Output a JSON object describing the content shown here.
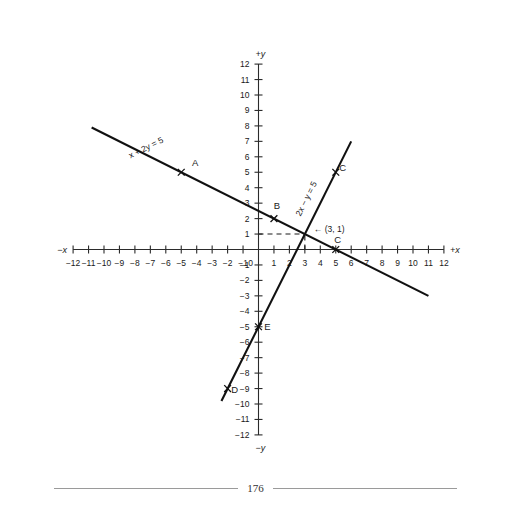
{
  "chart_data": {
    "type": "line",
    "title": "",
    "xlabel": "+x",
    "ylabel": "+y",
    "xlabel_negative": "-x",
    "ylabel_negative": "-y",
    "xlim": [
      -12,
      12
    ],
    "ylim": [
      -12,
      12
    ],
    "grid": false,
    "legend_position": "inline-rotated-labels",
    "x_tick_labels": [
      "-12",
      "-11",
      "-10",
      "-9",
      "-8",
      "-7",
      "-6",
      "-5",
      "-4",
      "-3",
      "-2",
      "-1",
      "0",
      "1",
      "2",
      "3",
      "4",
      "5",
      "6",
      "7",
      "8",
      "9",
      "10",
      "11",
      "12"
    ],
    "y_tick_labels": [
      "12",
      "11",
      "10",
      "9",
      "8",
      "7",
      "6",
      "5",
      "4",
      "3",
      "2",
      "1",
      "0",
      "-1",
      "-2",
      "-3",
      "-4",
      "-5",
      "-6",
      "-7",
      "-8",
      "-9",
      "-10",
      "-11",
      "-12"
    ],
    "origin_label": "0",
    "series": [
      {
        "name": "x + 2y = 5",
        "equation_label": "x + 2y = 5",
        "slope": -0.5,
        "y_intercept": 2.5,
        "x_start": -10.8,
        "x_end": 11.0,
        "label_rotation_deg": -26.6
      },
      {
        "name": "2x - y = 5",
        "equation_label": "2x - y = 5",
        "slope": 2.0,
        "y_intercept": -5.0,
        "x_start": -2.4,
        "x_end": 6.0,
        "label_rotation_deg": -63.4
      }
    ],
    "intersection": {
      "x": 3,
      "y": 1,
      "annotation": "(3, 1)",
      "arrow": "←"
    },
    "marked_points": [
      {
        "label": "A",
        "x": -5,
        "y": 5,
        "label_dx": 14,
        "label_dy": -6
      },
      {
        "label": "B",
        "x": 1,
        "y": 2,
        "label_dx": 3,
        "label_dy": -10
      },
      {
        "label": "C",
        "x": 5,
        "y": 5,
        "label_dx": 7,
        "label_dy": -1
      },
      {
        "label": "C",
        "x": 5,
        "y": 0,
        "label_dx": 2,
        "label_dy": -7
      },
      {
        "label": "D",
        "x": -2,
        "y": -9,
        "label_dx": 7,
        "label_dy": 4
      },
      {
        "label": "E",
        "x": 0,
        "y": -5,
        "label_dx": 9,
        "label_dy": 3
      }
    ],
    "guides": [
      {
        "type": "dashed-horizontal",
        "y": 1,
        "x_from": 0,
        "x_to": 3
      },
      {
        "type": "dashed-vertical",
        "x": 3,
        "y_from": 0,
        "y_to": 1
      }
    ]
  },
  "footer": {
    "page_number": "176"
  },
  "colors": {
    "line": "#111111",
    "axis": "#2b2b2b",
    "text": "#1a1a1a",
    "footer_rule": "#9a9a9a",
    "background": "#ffffff"
  }
}
